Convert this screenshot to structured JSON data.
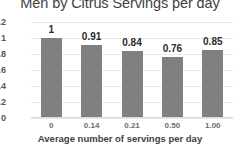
{
  "chart_data": {
    "type": "bar",
    "title": "Men by Citrus Servings per day",
    "xlabel": "Average number of servings per day",
    "ylabel": "",
    "categories": [
      "0",
      "0.14",
      "0.21",
      "0.50",
      "1.00"
    ],
    "values": [
      1,
      0.91,
      0.84,
      0.76,
      0.85
    ],
    "data_labels": [
      "1",
      "0.91",
      "0.84",
      "0.76",
      "0.85"
    ],
    "ylim": [
      0,
      1.2
    ],
    "yticks": [
      "0",
      "0.2",
      "0.4",
      "0.6",
      "0.8",
      "1",
      "1.2"
    ],
    "ytick_values": [
      0,
      0.2,
      0.4,
      0.6,
      0.8,
      1,
      1.2
    ],
    "grid": true,
    "legend": false,
    "bar_color": "#808080",
    "gridline_color": "#eaeaea",
    "background_color": "#ffffff",
    "title_color": "#3f3f3f"
  }
}
